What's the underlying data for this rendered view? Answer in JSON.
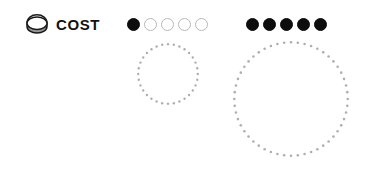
{
  "canvas": {
    "width": 366,
    "height": 172,
    "background": "#ffffff"
  },
  "cost_label": {
    "icon": "coin-icon",
    "text": "COST",
    "text_color": "#111111"
  },
  "pip_groups": [
    {
      "name": "cost-pips-group-1",
      "total": 5,
      "filled": 1,
      "pips": [
        "filled",
        "empty",
        "empty",
        "empty",
        "empty"
      ],
      "filled_color": "#0d0d0d",
      "empty_border_color": "#b9b9b9"
    },
    {
      "name": "cost-pips-group-2",
      "total": 5,
      "filled": 5,
      "pips": [
        "filled",
        "filled",
        "filled",
        "filled",
        "filled"
      ],
      "filled_color": "#0d0d0d",
      "empty_border_color": "#b9b9b9"
    }
  ],
  "dotted_circles": [
    {
      "name": "dotted-circle-small",
      "diameter": 64,
      "dot_count": 32,
      "dot_radius": 1.2,
      "dot_color": "#b0aeb3"
    },
    {
      "name": "dotted-circle-large",
      "diameter": 118,
      "dot_count": 52,
      "dot_radius": 1.3,
      "dot_color": "#b0aeb3"
    }
  ]
}
